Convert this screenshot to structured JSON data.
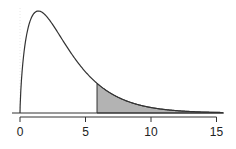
{
  "chart_data": {
    "type": "area",
    "title": "",
    "xlabel": "",
    "ylabel": "",
    "distribution": "chi-square",
    "df": 3,
    "xlim": [
      0,
      15.5
    ],
    "x_ticks": [
      0,
      5,
      10,
      15
    ],
    "x_tick_labels": [
      "0",
      "5",
      "10",
      "15"
    ],
    "shaded_region": {
      "from": 5.88,
      "to": 15.5,
      "color": "#b3b3b3"
    },
    "grid": false,
    "legend": null
  }
}
